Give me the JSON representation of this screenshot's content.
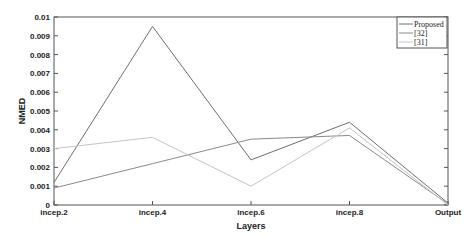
{
  "chart_data": {
    "type": "line",
    "title": "",
    "xlabel": "Layers",
    "ylabel": "NMED",
    "categories": [
      "incep.2",
      "incep.4",
      "incep.6",
      "incep.8",
      "Output"
    ],
    "ylim": [
      0,
      0.01
    ],
    "yticks": [
      "0",
      "0.001",
      "0.002",
      "0.003",
      "0.004",
      "0.005",
      "0.006",
      "0.007",
      "0.008",
      "0.009",
      "0.01"
    ],
    "grid": false,
    "legend_position": "upper right",
    "series": [
      {
        "name": "Proposed",
        "color": "#6e6e6e",
        "values": [
          0.0012,
          0.0095,
          0.0024,
          0.0044,
          0.0001
        ]
      },
      {
        "name": "[32]",
        "color": "#8a8a8a",
        "values": [
          0.0009,
          0.0022,
          0.0035,
          0.0037,
          5e-05
        ]
      },
      {
        "name": "[31]",
        "color": "#c4c4c4",
        "values": [
          0.003,
          0.0036,
          0.001,
          0.0041,
          0.0
        ]
      }
    ]
  }
}
